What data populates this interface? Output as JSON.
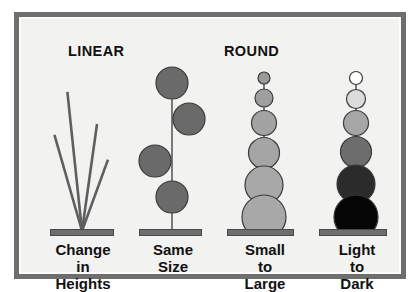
{
  "figure": {
    "background_color": "#f2f2f0",
    "frame_color": "#6e6e6e",
    "bar_color": "#6e6e6e",
    "text_color": "#111111",
    "headings": [
      {
        "id": "linear",
        "label": "LINEAR"
      },
      {
        "id": "round",
        "label": "ROUND"
      }
    ],
    "columns": [
      {
        "id": "change-in-heights",
        "group": "LINEAR",
        "caption_lines": [
          "Change",
          "in",
          "Heights"
        ],
        "element_type": "lines",
        "stroke_color": "#5f5f5f",
        "lines": [
          {
            "angle_deg": -16,
            "length": 100
          },
          {
            "angle_deg": -6,
            "length": 140
          },
          {
            "angle_deg": 8,
            "length": 108
          },
          {
            "angle_deg": 20,
            "length": 76
          }
        ]
      },
      {
        "id": "same-size",
        "group": "ROUND",
        "caption_lines": [
          "Same",
          "Size"
        ],
        "element_type": "circles",
        "stem_color": "#7a7a7a",
        "circles": [
          {
            "offset_x": 0,
            "cy": 18,
            "r": 16,
            "fill": "#6a6a6a"
          },
          {
            "offset_x": 17,
            "cy": 54,
            "r": 16,
            "fill": "#6a6a6a"
          },
          {
            "offset_x": -17,
            "cy": 96,
            "r": 16,
            "fill": "#6a6a6a"
          },
          {
            "offset_x": 0,
            "cy": 132,
            "r": 16,
            "fill": "#6a6a6a"
          }
        ]
      },
      {
        "id": "small-to-large",
        "group": "ROUND",
        "caption_lines": [
          "Small",
          "to",
          "Large"
        ],
        "element_type": "circles",
        "stem_color": "#7a7a7a",
        "circles": [
          {
            "offset_x": 0,
            "cy": 13,
            "r": 6,
            "fill": "#9a9a9a"
          },
          {
            "offset_x": 0,
            "cy": 33,
            "r": 9,
            "fill": "#9f9f9f"
          },
          {
            "offset_x": 0,
            "cy": 58,
            "r": 12.5,
            "fill": "#a3a3a3"
          },
          {
            "offset_x": 0,
            "cy": 88,
            "r": 15.5,
            "fill": "#a5a5a5"
          },
          {
            "offset_x": 0,
            "cy": 120,
            "r": 19,
            "fill": "#a8a8a8"
          },
          {
            "offset_x": 0,
            "cy": 152,
            "r": 22,
            "fill": "#a8a8a8"
          }
        ]
      },
      {
        "id": "light-to-dark",
        "group": "ROUND",
        "caption_lines": [
          "Light",
          "to",
          "Dark"
        ],
        "element_type": "circles",
        "stem_color": "#7a7a7a",
        "circles": [
          {
            "offset_x": 0,
            "cy": 13,
            "r": 6.5,
            "fill": "#ffffff"
          },
          {
            "offset_x": 0,
            "cy": 34,
            "r": 9.5,
            "fill": "#dcdcdc"
          },
          {
            "offset_x": 0,
            "cy": 58,
            "r": 12.5,
            "fill": "#a6a6a6"
          },
          {
            "offset_x": 0,
            "cy": 87,
            "r": 15.5,
            "fill": "#6d6d6d"
          },
          {
            "offset_x": 0,
            "cy": 119,
            "r": 19,
            "fill": "#2b2b2b"
          },
          {
            "offset_x": 0,
            "cy": 152,
            "r": 22,
            "fill": "#050505"
          }
        ]
      }
    ]
  }
}
